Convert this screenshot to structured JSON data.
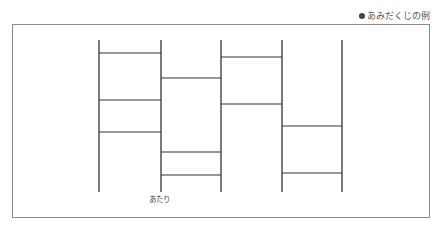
{
  "caption": {
    "bullet": "●",
    "text": "あみだくじの例"
  },
  "diagram": {
    "title": "あみだくじの例",
    "verticals": [
      {
        "x": 99,
        "y1": 40,
        "y2": 192
      },
      {
        "x": 161,
        "y1": 40,
        "y2": 192
      },
      {
        "x": 221,
        "y1": 40,
        "y2": 192
      },
      {
        "x": 282,
        "y1": 40,
        "y2": 192
      },
      {
        "x": 342,
        "y1": 40,
        "y2": 192
      }
    ],
    "rungs": [
      {
        "from": 0,
        "to": 1,
        "y": 53
      },
      {
        "from": 0,
        "to": 1,
        "y": 100
      },
      {
        "from": 0,
        "to": 1,
        "y": 132
      },
      {
        "from": 1,
        "to": 2,
        "y": 78
      },
      {
        "from": 1,
        "to": 2,
        "y": 152
      },
      {
        "from": 1,
        "to": 2,
        "y": 175
      },
      {
        "from": 2,
        "to": 3,
        "y": 57
      },
      {
        "from": 2,
        "to": 3,
        "y": 104
      },
      {
        "from": 3,
        "to": 4,
        "y": 126
      },
      {
        "from": 3,
        "to": 4,
        "y": 173
      }
    ],
    "bottom_labels": [
      {
        "column": 1,
        "text": "あたり"
      }
    ],
    "line_color": "#333333"
  }
}
